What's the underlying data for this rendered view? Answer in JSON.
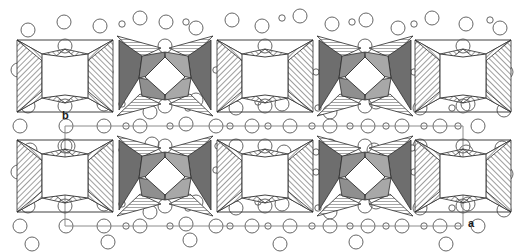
{
  "figure": {
    "type": "crystal-structure-projection",
    "title": "",
    "background_color": "#ffffff",
    "width": 520,
    "height": 252
  },
  "axes": {
    "b_label": "b",
    "a_label": "a",
    "b_label_x": 62,
    "b_label_y": 110,
    "a_label_x": 468,
    "a_label_y": 218
  },
  "unit_cell": {
    "stroke_color": "#8c8c8c",
    "stroke_width": 1,
    "left": 65,
    "right": 463,
    "top": 126,
    "bottom": 226,
    "origin_x": 463,
    "origin_y": 226
  },
  "colors": {
    "outline": "#2b2b2b",
    "hatch_light_fill": "#ffffff",
    "hatch_light_line": "#4d4d4d",
    "dark_face_a": "#6e6e6e",
    "dark_face_b": "#8f8f8f",
    "dark_face_c": "#a8a8a8",
    "atom_stroke": "#555555",
    "atom_fill": "#ffffff"
  },
  "clusters": {
    "rows": [
      {
        "name": "upper-row",
        "center_y": 76
      },
      {
        "name": "lower-row",
        "center_y": 176
      }
    ],
    "columns": [
      {
        "center_x": 65,
        "style": "hatched"
      },
      {
        "center_x": 165,
        "style": "dark"
      },
      {
        "center_x": 265,
        "style": "hatched"
      },
      {
        "center_x": 365,
        "style": "dark"
      },
      {
        "center_x": 463,
        "style": "hatched"
      }
    ],
    "half_width": 48,
    "half_height": 40,
    "core_half_width": 23,
    "core_half_height": 22,
    "description": "four-lobed star polyhedra clusters"
  },
  "atoms": {
    "large_radius": 7,
    "small_radius": 3.2,
    "large": [
      [
        28,
        30
      ],
      [
        64,
        22
      ],
      [
        100,
        26
      ],
      [
        140,
        18
      ],
      [
        166,
        22
      ],
      [
        196,
        28
      ],
      [
        232,
        20
      ],
      [
        262,
        26
      ],
      [
        300,
        16
      ],
      [
        332,
        24
      ],
      [
        366,
        20
      ],
      [
        398,
        28
      ],
      [
        432,
        18
      ],
      [
        466,
        24
      ],
      [
        500,
        28
      ],
      [
        18,
        70
      ],
      [
        106,
        72
      ],
      [
        196,
        68
      ],
      [
        238,
        78
      ],
      [
        286,
        70
      ],
      [
        330,
        74
      ],
      [
        376,
        70
      ],
      [
        424,
        76
      ],
      [
        470,
        70
      ],
      [
        506,
        72
      ],
      [
        28,
        106
      ],
      [
        104,
        104
      ],
      [
        150,
        112
      ],
      [
        196,
        100
      ],
      [
        236,
        108
      ],
      [
        282,
        104
      ],
      [
        330,
        112
      ],
      [
        376,
        102
      ],
      [
        420,
        108
      ],
      [
        468,
        104
      ],
      [
        504,
        110
      ],
      [
        20,
        126
      ],
      [
        66,
        126
      ],
      [
        104,
        126
      ],
      [
        140,
        126
      ],
      [
        186,
        124
      ],
      [
        216,
        126
      ],
      [
        252,
        126
      ],
      [
        290,
        126
      ],
      [
        330,
        126
      ],
      [
        368,
        126
      ],
      [
        402,
        126
      ],
      [
        440,
        126
      ],
      [
        478,
        126
      ],
      [
        30,
        150
      ],
      [
        68,
        146
      ],
      [
        106,
        152
      ],
      [
        152,
        144
      ],
      [
        196,
        150
      ],
      [
        236,
        146
      ],
      [
        284,
        152
      ],
      [
        330,
        146
      ],
      [
        374,
        150
      ],
      [
        420,
        146
      ],
      [
        466,
        152
      ],
      [
        502,
        148
      ],
      [
        18,
        172
      ],
      [
        104,
        172
      ],
      [
        196,
        170
      ],
      [
        238,
        178
      ],
      [
        286,
        172
      ],
      [
        330,
        176
      ],
      [
        376,
        172
      ],
      [
        424,
        178
      ],
      [
        470,
        172
      ],
      [
        506,
        174
      ],
      [
        28,
        206
      ],
      [
        104,
        204
      ],
      [
        150,
        212
      ],
      [
        196,
        202
      ],
      [
        236,
        208
      ],
      [
        282,
        204
      ],
      [
        330,
        212
      ],
      [
        376,
        202
      ],
      [
        420,
        208
      ],
      [
        468,
        204
      ],
      [
        504,
        210
      ],
      [
        20,
        226
      ],
      [
        66,
        226
      ],
      [
        104,
        226
      ],
      [
        140,
        226
      ],
      [
        186,
        224
      ],
      [
        216,
        226
      ],
      [
        252,
        226
      ],
      [
        290,
        226
      ],
      [
        330,
        226
      ],
      [
        368,
        226
      ],
      [
        402,
        226
      ],
      [
        440,
        226
      ],
      [
        478,
        226
      ],
      [
        32,
        244
      ],
      [
        108,
        242
      ],
      [
        190,
        240
      ],
      [
        280,
        244
      ],
      [
        356,
        242
      ],
      [
        446,
        244
      ]
    ],
    "small": [
      [
        122,
        24
      ],
      [
        186,
        22
      ],
      [
        282,
        18
      ],
      [
        352,
        22
      ],
      [
        414,
        24
      ],
      [
        490,
        20
      ],
      [
        148,
        72
      ],
      [
        216,
        70
      ],
      [
        250,
        74
      ],
      [
        316,
        72
      ],
      [
        348,
        70
      ],
      [
        414,
        72
      ],
      [
        448,
        70
      ],
      [
        122,
        104
      ],
      [
        188,
        108
      ],
      [
        258,
        102
      ],
      [
        318,
        108
      ],
      [
        386,
        104
      ],
      [
        452,
        108
      ],
      [
        126,
        126
      ],
      [
        170,
        126
      ],
      [
        230,
        126
      ],
      [
        268,
        126
      ],
      [
        312,
        126
      ],
      [
        350,
        126
      ],
      [
        386,
        126
      ],
      [
        424,
        126
      ],
      [
        458,
        126
      ],
      [
        122,
        150
      ],
      [
        218,
        146
      ],
      [
        316,
        152
      ],
      [
        412,
        148
      ],
      [
        148,
        172
      ],
      [
        216,
        170
      ],
      [
        250,
        174
      ],
      [
        316,
        172
      ],
      [
        348,
        170
      ],
      [
        414,
        172
      ],
      [
        448,
        170
      ],
      [
        122,
        204
      ],
      [
        188,
        208
      ],
      [
        258,
        202
      ],
      [
        318,
        208
      ],
      [
        386,
        204
      ],
      [
        452,
        208
      ],
      [
        126,
        226
      ],
      [
        170,
        226
      ],
      [
        230,
        226
      ],
      [
        268,
        226
      ],
      [
        312,
        226
      ],
      [
        350,
        226
      ],
      [
        386,
        226
      ],
      [
        424,
        226
      ],
      [
        458,
        226
      ]
    ]
  }
}
